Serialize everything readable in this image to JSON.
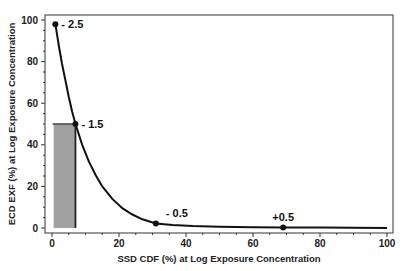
{
  "chart_data": {
    "type": "line",
    "title": "",
    "xlabel": "SSD CDF (%) at Log Exposure Concentration",
    "ylabel": "ECD EXF (%) at Log Exposure Concentration",
    "xlim": [
      0,
      100
    ],
    "ylim": [
      0,
      100
    ],
    "x_ticks": [
      0,
      20,
      40,
      60,
      80,
      100
    ],
    "y_ticks": [
      0,
      20,
      40,
      60,
      80,
      100
    ],
    "grid": false,
    "legend": null,
    "curve": {
      "x": [
        1,
        2,
        3,
        4,
        5,
        6,
        7,
        9,
        11,
        13,
        15,
        18,
        21,
        24,
        27,
        31,
        36,
        42,
        50,
        60,
        69,
        80,
        90,
        100
      ],
      "y": [
        98,
        88,
        79,
        71,
        63,
        56,
        50,
        40,
        32,
        25.5,
        20,
        14,
        9.5,
        6.5,
        4.2,
        2.2,
        1.4,
        0.9,
        0.6,
        0.4,
        0.3,
        0.2,
        0.1,
        0.05
      ]
    },
    "points": [
      {
        "label": "- 2.5",
        "x": 1,
        "y": 98
      },
      {
        "label": "- 1.5",
        "x": 7,
        "y": 50
      },
      {
        "label": "- 0.5",
        "x": 31,
        "y": 2.2
      },
      {
        "label": "+0.5",
        "x": 69,
        "y": 0.3
      }
    ],
    "shaded_region": {
      "x0": 0.5,
      "x1": 7,
      "y0": 0,
      "y1": 50,
      "color": "#a0a0a0"
    }
  },
  "colors": {
    "curve": "#111111",
    "axis": "#333333",
    "shade": "#a0a0a0",
    "frame": "#555555"
  }
}
